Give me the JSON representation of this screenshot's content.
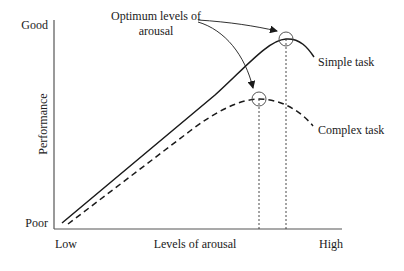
{
  "diagram": {
    "y_axis": {
      "label": "Performance",
      "top_label": "Good",
      "bottom_label": "Poor"
    },
    "x_axis": {
      "label": "Levels of arousal",
      "left_label": "Low",
      "right_label": "High"
    },
    "annotation": {
      "line1": "Optimum levels of",
      "line2": "arousal"
    },
    "curves": [
      {
        "name": "Simple task",
        "style": "solid",
        "peak": "higher arousal, higher performance"
      },
      {
        "name": "Complex task",
        "style": "dashed",
        "peak": "lower arousal, lower performance"
      }
    ],
    "colors": {
      "line": "#1a1a1a",
      "axis": "#555555",
      "background": "#ffffff"
    }
  }
}
